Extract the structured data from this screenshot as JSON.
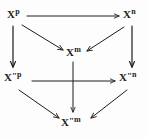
{
  "figure": {
    "kind": "commutative-diagram",
    "background_color": "#fdfdfd",
    "ink_color": "#1c1c1c",
    "width": 149,
    "height": 138
  },
  "nodes": [
    {
      "id": "xp",
      "base": "X",
      "prime": "",
      "sup": "p",
      "label": "X^p",
      "x": 16,
      "y": 15
    },
    {
      "id": "xn",
      "base": "X",
      "prime": "",
      "sup": "n",
      "label": "X^n",
      "x": 132,
      "y": 15
    },
    {
      "id": "xm",
      "base": "X",
      "prime": "",
      "sup": "m",
      "label": "X^m",
      "x": 73,
      "y": 53
    },
    {
      "id": "xppp",
      "base": "X",
      "prime": "\"",
      "sup": "p",
      "label": "X\"^p",
      "x": 16,
      "y": 78
    },
    {
      "id": "xppn",
      "base": "X",
      "prime": "\"",
      "sup": "n",
      "label": "X\"^n",
      "x": 131,
      "y": 78
    },
    {
      "id": "xppm",
      "base": "X",
      "prime": "\"",
      "sup": "m",
      "label": "X\"^m",
      "x": 73,
      "y": 123
    }
  ],
  "arrows": [
    {
      "id": "xp-to-xn",
      "from": "xp",
      "to": "xn",
      "style": "solid",
      "label": ""
    },
    {
      "id": "xp-to-xm",
      "from": "xp",
      "to": "xm",
      "style": "solid",
      "label": ""
    },
    {
      "id": "xp-to-xppp",
      "from": "xp",
      "to": "xppp",
      "style": "solid",
      "label": ""
    },
    {
      "id": "xn-to-xm",
      "from": "xn",
      "to": "xm",
      "style": "solid",
      "label": ""
    },
    {
      "id": "xn-to-xppn",
      "from": "xn",
      "to": "xppn",
      "style": "solid",
      "label": ""
    },
    {
      "id": "xm-to-xppm",
      "from": "xm",
      "to": "xppm",
      "style": "solid",
      "label": ""
    },
    {
      "id": "xppp-to-xppn",
      "from": "xppp",
      "to": "xppn",
      "style": "solid",
      "label": ""
    },
    {
      "id": "xppp-to-xppm",
      "from": "xppp",
      "to": "xppm",
      "style": "solid",
      "label": ""
    },
    {
      "id": "xppn-to-xppm",
      "from": "xppn",
      "to": "xppm",
      "style": "solid",
      "label": ""
    }
  ]
}
